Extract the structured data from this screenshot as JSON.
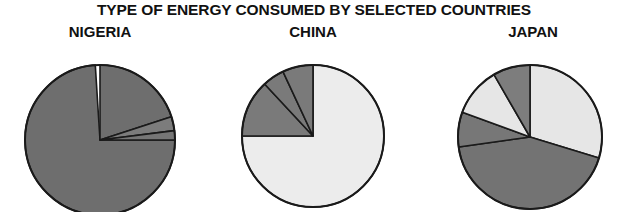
{
  "chart_data": {
    "type": "pie",
    "title": "TYPE OF ENERGY CONSUMED BY SELECTED COUNTRIES",
    "xlabel": "",
    "ylabel": "",
    "legend_position": "none",
    "grid": false,
    "charts": [
      {
        "name": "NIGERIA",
        "center": [
          100,
          140
        ],
        "radius": 75,
        "slices": [
          {
            "label": "slice-1",
            "value": 74,
            "color": "#6e6e6e",
            "start_deg": 90,
            "end_deg": 356.4
          },
          {
            "label": "slice-2",
            "value": 20,
            "color": "#6e6e6e",
            "start_deg": 0,
            "end_deg": 72
          },
          {
            "label": "slice-3",
            "value": 3,
            "color": "#7c7c7c",
            "start_deg": 72,
            "end_deg": 82.8
          },
          {
            "label": "slice-4",
            "value": 3,
            "color": "#767676",
            "start_deg": 82.8,
            "end_deg": 90
          }
        ]
      },
      {
        "name": "CHINA",
        "center": [
          313,
          136
        ],
        "radius": 71,
        "slices": [
          {
            "label": "slice-1",
            "value": 75,
            "color": "#ececec",
            "start_deg": 0,
            "end_deg": 270
          },
          {
            "label": "slice-2",
            "value": 13,
            "color": "#7a7a7a",
            "start_deg": 270,
            "end_deg": 317
          },
          {
            "label": "slice-3",
            "value": 5,
            "color": "#7a7a7a",
            "start_deg": 317,
            "end_deg": 335
          },
          {
            "label": "slice-4",
            "value": 7,
            "color": "#7a7a7a",
            "start_deg": 335,
            "end_deg": 360
          }
        ]
      },
      {
        "name": "JAPAN",
        "center": [
          530,
          137
        ],
        "radius": 72,
        "slices": [
          {
            "label": "slice-1",
            "value": 30,
            "color": "#e6e6e6",
            "start_deg": 0,
            "end_deg": 107
          },
          {
            "label": "slice-2",
            "value": 43,
            "color": "#737373",
            "start_deg": 107,
            "end_deg": 262
          },
          {
            "label": "slice-3",
            "value": 8,
            "color": "#777777",
            "start_deg": 262,
            "end_deg": 290
          },
          {
            "label": "slice-4",
            "value": 11,
            "color": "#e6e6e6",
            "start_deg": 290,
            "end_deg": 330
          },
          {
            "label": "slice-5",
            "value": 8,
            "color": "#7d7d7d",
            "start_deg": 330,
            "end_deg": 360
          }
        ]
      }
    ]
  }
}
